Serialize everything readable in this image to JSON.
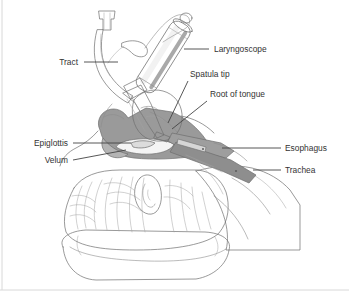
{
  "figure": {
    "background_color": "#ffffff",
    "width": 349,
    "height": 295
  },
  "palette": {
    "outline": "#6f6f6f",
    "outline_soft": "#8d8d8d",
    "outline_fine": "#a2a2a2",
    "label_text": "#333333",
    "leader_line": "#444444",
    "pharynx_fill": "#9a9a9a",
    "airway_fill": "#8e8e8e",
    "tongue_fill": "#d2d2d2",
    "skin_fill": "#fdfdfd",
    "tube_fill": "#ececec",
    "handle_fill": "#cfcfcf",
    "handle_highlight": "#f2f2f2",
    "blade_fill": "#bdbdbd",
    "pillow_fill": "#ffffff",
    "frame": "#d8d8d8"
  },
  "labels": [
    {
      "id": "tract",
      "text": "Tract",
      "align": "right",
      "text_x": 78,
      "text_y": 65,
      "leader": "M 84 62 L 118 62"
    },
    {
      "id": "laryngoscope",
      "text": "Laryngoscope",
      "align": "left",
      "text_x": 214,
      "text_y": 52,
      "leader": "M 184 49 L 209 49"
    },
    {
      "id": "spatula-tip",
      "text": "Spatula tip",
      "align": "left",
      "text_x": 190,
      "text_y": 77,
      "leader": "M 188 81 L 168 123"
    },
    {
      "id": "root-of-tongue",
      "text": "Root of tongue",
      "align": "left",
      "text_x": 210,
      "text_y": 97,
      "leader": "M 207 101 L 172 129"
    },
    {
      "id": "epiglottis",
      "text": "Epiglottis",
      "align": "right",
      "text_x": 68,
      "text_y": 146,
      "leader": "M 73 143 L 131 143"
    },
    {
      "id": "velum",
      "text": "Velum",
      "align": "right",
      "text_x": 68,
      "text_y": 163,
      "leader": "M 73 160 L 126 150"
    },
    {
      "id": "esophagus",
      "text": "Esophagus",
      "align": "left",
      "text_x": 285,
      "text_y": 151,
      "leader": "M 222 148 L 281 148"
    },
    {
      "id": "trachea",
      "text": "Trachea",
      "align": "left",
      "text_x": 285,
      "text_y": 173,
      "leader": "M 253 170 L 281 170"
    }
  ],
  "structures": [
    {
      "id": "laryngoscope-handle",
      "name": "Laryngoscope handle"
    },
    {
      "id": "laryngoscope-blade",
      "name": "Laryngoscope blade / spatula"
    },
    {
      "id": "endotracheal-tube",
      "name": "Endotracheal tube"
    },
    {
      "id": "tube-connector",
      "name": "Tube connector"
    },
    {
      "id": "pilot-balloon",
      "name": "Pilot balloon line"
    },
    {
      "id": "tongue",
      "name": "Tongue"
    },
    {
      "id": "pharynx",
      "name": "Pharyngeal cavity"
    },
    {
      "id": "epiglottis-structure",
      "name": "Epiglottis"
    },
    {
      "id": "velum-structure",
      "name": "Soft palate (velum)"
    },
    {
      "id": "trachea-structure",
      "name": "Trachea"
    },
    {
      "id": "esophagus-structure",
      "name": "Esophagus"
    },
    {
      "id": "head",
      "name": "Patient head with hair"
    },
    {
      "id": "ear",
      "name": "Ear"
    },
    {
      "id": "pillow",
      "name": "Pillow"
    }
  ]
}
